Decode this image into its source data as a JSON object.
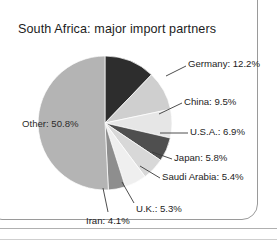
{
  "figure": {
    "title": "South Africa: major import partners",
    "background": "#ffffff",
    "frame_color": "#9a9a9a"
  },
  "chart_data": {
    "type": "pie",
    "title": "South Africa: major import partners",
    "xlabel": "",
    "ylabel": "",
    "units": "percent",
    "legend_position": "none",
    "labels_inline": true,
    "start_angle_deg": -90,
    "direction": "clockwise",
    "categories": [
      "Germany",
      "China",
      "U.S.A.",
      "Japan",
      "Saudi Arabia",
      "U.K.",
      "Iran",
      "Other"
    ],
    "values": [
      12.2,
      9.5,
      6.9,
      5.8,
      5.4,
      5.3,
      4.1,
      50.8
    ],
    "colors": [
      "#2d2d2d",
      "#cfcfcf",
      "#e6e6e6",
      "#4f4f4f",
      "#d8d8d8",
      "#efefef",
      "#8e8e8e",
      "#b4b4b4"
    ],
    "slices": [
      {
        "name": "Germany",
        "value": 12.2,
        "label": "Germany: 12.2%",
        "color": "#2d2d2d"
      },
      {
        "name": "China",
        "value": 9.5,
        "label": "China: 9.5%",
        "color": "#cfcfcf"
      },
      {
        "name": "U.S.A.",
        "value": 6.9,
        "label": "U.S.A.: 6.9%",
        "color": "#e6e6e6"
      },
      {
        "name": "Japan",
        "value": 5.8,
        "label": "Japan: 5.8%",
        "color": "#4f4f4f"
      },
      {
        "name": "Saudi Arabia",
        "value": 5.4,
        "label": "Saudi Arabia: 5.4%",
        "color": "#d8d8d8"
      },
      {
        "name": "U.K.",
        "value": 5.3,
        "label": "U.K.: 5.3%",
        "color": "#efefef"
      },
      {
        "name": "Iran",
        "value": 4.1,
        "label": "Iran: 4.1%",
        "color": "#8e8e8e"
      },
      {
        "name": "Other",
        "value": 50.8,
        "label": "Other: 50.8%",
        "color": "#b4b4b4"
      }
    ],
    "total": 100.0
  },
  "labels": {
    "germany": "Germany: 12.2%",
    "china": "China: 9.5%",
    "usa": "U.S.A.: 6.9%",
    "japan": "Japan: 5.8%",
    "saudi_arabia": "Saudi Arabia: 5.4%",
    "uk": "U.K.: 5.3%",
    "iran": "Iran: 4.1%",
    "other": "Other: 50.8%"
  }
}
